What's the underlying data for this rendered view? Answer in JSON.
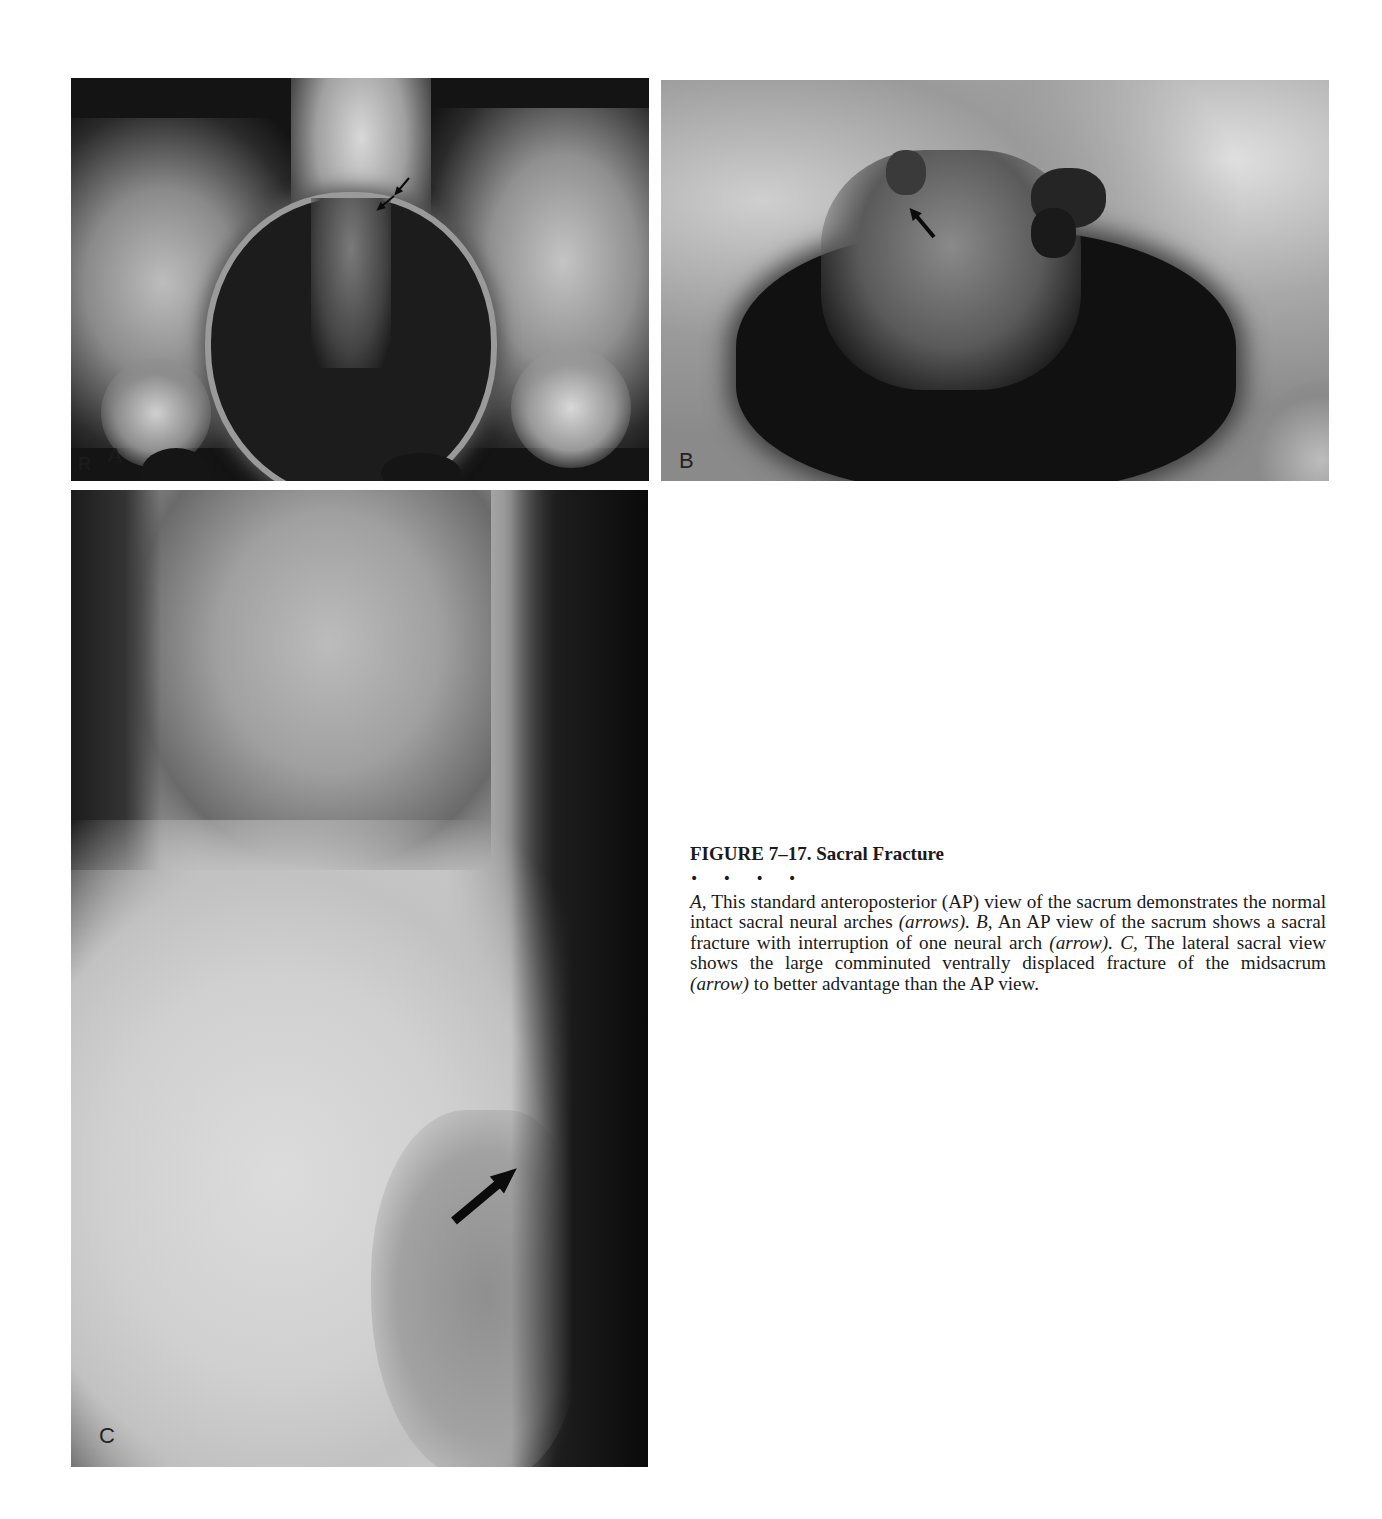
{
  "figure": {
    "title": "FIGURE 7–17. Sacral Fracture",
    "separator": "• • • •",
    "caption": {
      "a_label": "A,",
      "a_text": " This standard anteroposterior (AP) view of the sacrum demonstrates the normal intact sacral neural arches ",
      "a_paren": "(arrows).",
      "b_label": "B,",
      "b_text": " An AP view of the sacrum shows a sacral fracture with interruption of one neural arch ",
      "b_paren": "(arrow).",
      "c_label": "C,",
      "c_text": " The lateral sacral view shows the large comminuted ventrally displaced fracture of the midsacrum ",
      "c_paren": "(arrow)",
      "c_tail": " to better advantage than the AP view."
    }
  },
  "panels": [
    {
      "id": "A",
      "label": "A",
      "side_marker": "R",
      "description": "AP radiograph of pelvis/sacrum, normal neural arches",
      "arrows": 2
    },
    {
      "id": "B",
      "label": "B",
      "description": "AP radiograph of sacrum with fracture interrupting one neural arch",
      "arrows": 1
    },
    {
      "id": "C",
      "label": "C",
      "description": "Lateral sacral radiograph showing comminuted ventrally displaced midsacral fracture",
      "arrows": 1
    }
  ],
  "colors": {
    "page_background": "#ffffff",
    "text": "#1a1a1a",
    "arrow": "#0b0b0b"
  }
}
